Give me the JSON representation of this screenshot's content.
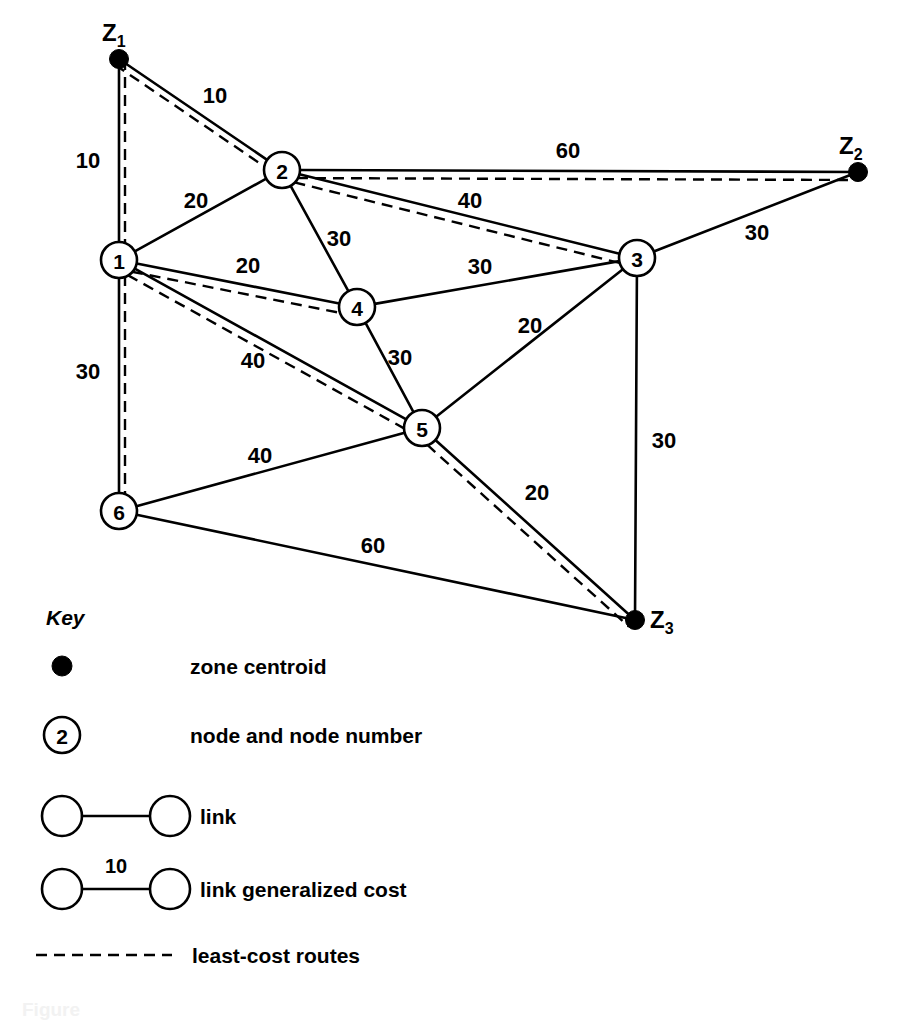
{
  "figure": {
    "type": "transport-network-diagram",
    "caption": "Figure"
  },
  "chart_data": {
    "type": "diagram",
    "title": "",
    "centroids": [
      {
        "id": "Z1",
        "label": "Z",
        "sub": "1",
        "x": 119,
        "y": 59
      },
      {
        "id": "Z2",
        "label": "Z",
        "sub": "2",
        "x": 858,
        "y": 172
      },
      {
        "id": "Z3",
        "label": "Z",
        "sub": "3",
        "x": 635,
        "y": 620
      }
    ],
    "nodes": [
      {
        "id": "1",
        "label": "1",
        "x": 119,
        "y": 260
      },
      {
        "id": "2",
        "label": "2",
        "x": 282,
        "y": 170
      },
      {
        "id": "3",
        "label": "3",
        "x": 637,
        "y": 258
      },
      {
        "id": "4",
        "label": "4",
        "x": 357,
        "y": 307
      },
      {
        "id": "5",
        "label": "5",
        "x": 422,
        "y": 428
      },
      {
        "id": "6",
        "label": "6",
        "x": 119,
        "y": 511
      }
    ],
    "links": [
      {
        "from": "Z1",
        "to": "2",
        "cost": "10",
        "label_x": 215,
        "label_y": 95
      },
      {
        "from": "Z1",
        "to": "1",
        "cost": "10",
        "label_x": 88,
        "label_y": 160
      },
      {
        "from": "1",
        "to": "2",
        "cost": "20",
        "label_x": 196,
        "label_y": 200
      },
      {
        "from": "2",
        "to": "Z2",
        "cost": "60",
        "label_x": 568,
        "label_y": 150
      },
      {
        "from": "2",
        "to": "3",
        "cost": "40",
        "label_x": 470,
        "label_y": 200
      },
      {
        "from": "2",
        "to": "4",
        "cost": "30",
        "label_x": 339,
        "label_y": 238
      },
      {
        "from": "1",
        "to": "4",
        "cost": "20",
        "label_x": 248,
        "label_y": 265
      },
      {
        "from": "4",
        "to": "3",
        "cost": "30",
        "label_x": 480,
        "label_y": 266
      },
      {
        "from": "3",
        "to": "Z2",
        "cost": "30",
        "label_x": 757,
        "label_y": 232
      },
      {
        "from": "3",
        "to": "5",
        "cost": "20",
        "label_x": 530,
        "label_y": 325
      },
      {
        "from": "4",
        "to": "5",
        "cost": "30",
        "label_x": 400,
        "label_y": 357
      },
      {
        "from": "1",
        "to": "5",
        "cost": "40",
        "label_x": 253,
        "label_y": 360
      },
      {
        "from": "1",
        "to": "6",
        "cost": "30",
        "label_x": 88,
        "label_y": 371
      },
      {
        "from": "3",
        "to": "Z3",
        "cost": "30",
        "label_x": 664,
        "label_y": 440
      },
      {
        "from": "6",
        "to": "5",
        "cost": "40",
        "label_x": 260,
        "label_y": 455
      },
      {
        "from": "5",
        "to": "Z3",
        "cost": "20",
        "label_x": 537,
        "label_y": 492
      },
      {
        "from": "6",
        "to": "Z3",
        "cost": "60",
        "label_x": 373,
        "label_y": 545
      }
    ],
    "least_cost_routes": [
      [
        "Z1",
        "2"
      ],
      [
        "Z1",
        "1"
      ],
      [
        "2",
        "Z2"
      ],
      [
        "2",
        "3"
      ],
      [
        "1",
        "4"
      ],
      [
        "1",
        "5"
      ],
      [
        "1",
        "6"
      ],
      [
        "5",
        "Z3"
      ]
    ]
  },
  "key": {
    "title": "Key",
    "items": [
      {
        "symbol": "zone-centroid-dot",
        "label": "zone centroid"
      },
      {
        "symbol": "node-circle",
        "label": "node and node number",
        "inner": "2"
      },
      {
        "symbol": "link-pair",
        "label": "link"
      },
      {
        "symbol": "link-cost-pair",
        "label": "link generalized cost",
        "cost": "10"
      },
      {
        "symbol": "dashed-line",
        "label": "least-cost routes"
      }
    ]
  }
}
